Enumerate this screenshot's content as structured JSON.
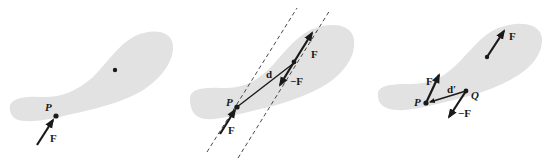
{
  "figure": {
    "colors": {
      "body_fill": "#e2e2e2",
      "ink": "#1a1a1a",
      "background": "#ffffff"
    },
    "panels": [
      {
        "id": "panel-1",
        "labels": {
          "point_p": "P",
          "force": "F"
        }
      },
      {
        "id": "panel-2",
        "labels": {
          "point_p": "P",
          "force_at_p": "F",
          "force_upper": "F",
          "force_negative": "−F",
          "moment_arm": "d"
        }
      },
      {
        "id": "panel-3",
        "labels": {
          "point_p": "P",
          "point_q": "Q",
          "force_centroid": "F",
          "force_at_p": "F",
          "force_negative": "−F",
          "moment_arm": "d′"
        }
      }
    ]
  }
}
